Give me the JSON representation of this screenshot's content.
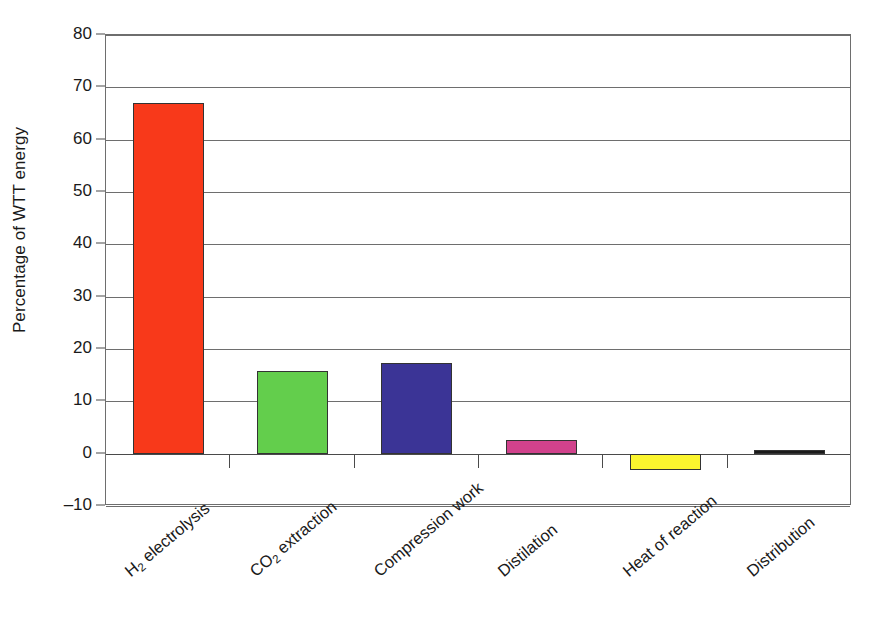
{
  "chart_data": {
    "type": "bar",
    "title": "",
    "xlabel": "",
    "ylabel": "Percentage of WTT energy",
    "ylim": [
      -10,
      80
    ],
    "ytick_step": 10,
    "grid": true,
    "legend": false,
    "categories": [
      "H₂ electrolysis",
      "CO₂ extraction",
      "Compression work",
      "Distilation",
      "Heat of reaction",
      "Distribution"
    ],
    "values": [
      67,
      15.8,
      17.4,
      2.6,
      -3.2,
      0.5
    ],
    "colors": [
      "#F8391A",
      "#63CE4C",
      "#3B3496",
      "#D1428C",
      "#FBF52E",
      "#1A1A1A"
    ],
    "ytick_labels": [
      "80",
      "70",
      "60",
      "50",
      "40",
      "30",
      "20",
      "10",
      "0",
      "–10"
    ],
    "ytick_values": [
      80,
      70,
      60,
      50,
      40,
      30,
      20,
      10,
      0,
      -10
    ]
  },
  "axis": {
    "y_title": "Percentage of WTT energy"
  },
  "categories_display": [
    {
      "pre": "H",
      "sub": "2",
      "post": " electrolysis"
    },
    {
      "pre": "CO",
      "sub": "2",
      "post": " extraction"
    },
    {
      "pre": "Compression work",
      "sub": "",
      "post": ""
    },
    {
      "pre": "Distilation",
      "sub": "",
      "post": ""
    },
    {
      "pre": "Heat of reaction",
      "sub": "",
      "post": ""
    },
    {
      "pre": "Distribution",
      "sub": "",
      "post": ""
    }
  ]
}
